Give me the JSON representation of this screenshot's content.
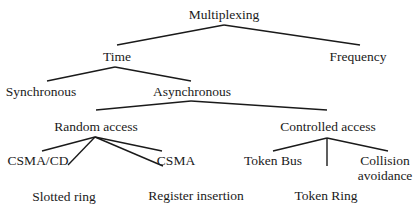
{
  "tree": {
    "root": "Multiplexing",
    "level1": {
      "time": "Time",
      "frequency": "Frequency"
    },
    "level2": {
      "synchronous": "Synchronous",
      "asynchronous": "Asynchronous"
    },
    "level3": {
      "random_access": "Random access",
      "controlled_access": "Controlled access"
    },
    "random_access_children": {
      "csma_cd": "CSMA/CD",
      "slotted_ring": "Slotted ring",
      "register_insertion": "Register insertion",
      "csma": "CSMA"
    },
    "controlled_access_children": {
      "token_bus": "Token Bus",
      "token_ring": "Token Ring",
      "collision_avoidance_line1": "Collision",
      "collision_avoidance_line2": "avoidance"
    }
  },
  "colors": {
    "line": "#1a1a1a",
    "text": "#1a1a1a",
    "background": "#ffffff"
  }
}
